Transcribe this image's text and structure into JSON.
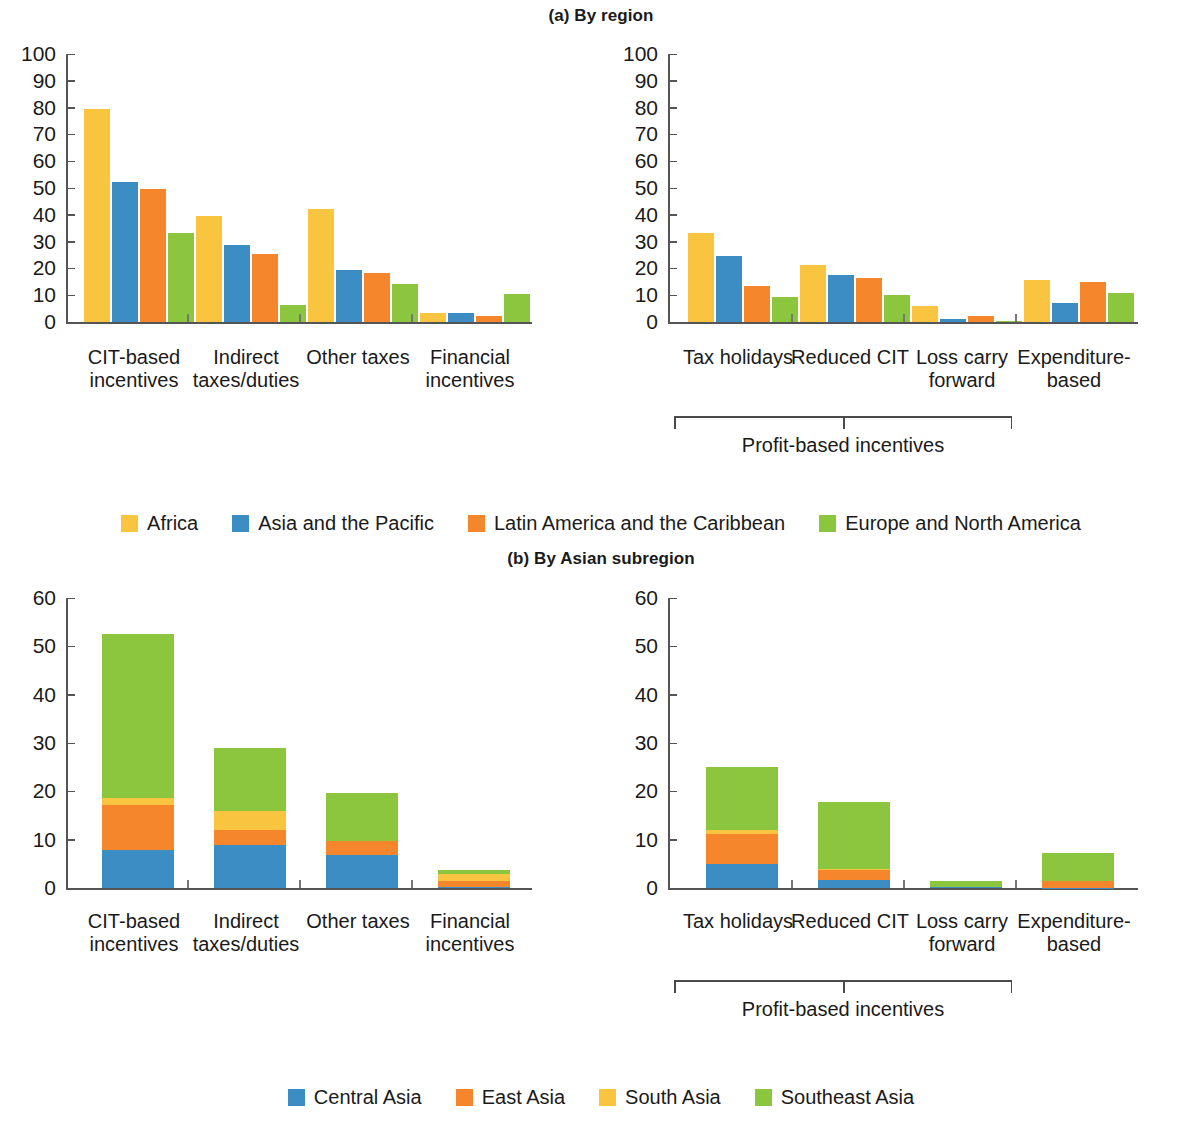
{
  "figure": {
    "panel_a_title": "(a) By region",
    "panel_b_title": "(b) By Asian subregion",
    "bracket_label": "Profit-based incentives"
  },
  "colors": {
    "africa": "#F9C440",
    "asia_pacific": "#3C8DC4",
    "latin_america": "#F6862C",
    "europe_north_america": "#8CC63E",
    "central_asia": "#3C8DC4",
    "east_asia": "#F6862C",
    "south_asia": "#F9C440",
    "southeast_asia": "#8CC63E"
  },
  "legend_a": [
    {
      "label": "Africa",
      "color": "#F9C440"
    },
    {
      "label": "Asia and the Pacific",
      "color": "#3C8DC4"
    },
    {
      "label": "Latin America and the Caribbean",
      "color": "#F6862C"
    },
    {
      "label": "Europe and North America",
      "color": "#8CC63E"
    }
  ],
  "legend_b": [
    {
      "label": "Central Asia",
      "color": "#3C8DC4"
    },
    {
      "label": "East Asia",
      "color": "#F6862C"
    },
    {
      "label": "South Asia",
      "color": "#F9C440"
    },
    {
      "label": "Southeast Asia",
      "color": "#8CC63E"
    }
  ],
  "chart_data": [
    {
      "id": "a-left",
      "type": "bar",
      "title": "(a) By region",
      "subtitle": "General incentive types, by region",
      "grouping": "grouped",
      "categories": [
        "CIT-based\nincentives",
        "Indirect\ntaxes/duties",
        "Other taxes",
        "Financial\nincentives"
      ],
      "series": [
        {
          "name": "Africa",
          "color": "#F9C440",
          "values": [
            79.5,
            39.5,
            42.2,
            3.2
          ]
        },
        {
          "name": "Asia and the Pacific",
          "color": "#3C8DC4",
          "values": [
            52.3,
            28.6,
            19.5,
            3.3
          ]
        },
        {
          "name": "Latin America and the Caribbean",
          "color": "#F6862C",
          "values": [
            49.5,
            25.5,
            18.3,
            2.3
          ]
        },
        {
          "name": "Europe and North America",
          "color": "#8CC63E",
          "values": [
            33.3,
            6.2,
            14.1,
            10.3
          ]
        }
      ],
      "ylim": [
        0,
        100
      ],
      "yticks": [
        0,
        10,
        20,
        30,
        40,
        50,
        60,
        70,
        80,
        90,
        100
      ],
      "ylabel": "",
      "xlabel": "",
      "grid": false,
      "legend_position": "bottom"
    },
    {
      "id": "a-right",
      "type": "bar",
      "title": "(a) By region",
      "subtitle": "Specific incentive instruments, by region",
      "grouping": "grouped",
      "categories": [
        "Tax holidays",
        "Reduced CIT",
        "Loss carry\nforward",
        "Expenditure-\nbased"
      ],
      "series": [
        {
          "name": "Africa",
          "color": "#F9C440",
          "values": [
            33.3,
            21.2,
            6.0,
            15.8
          ]
        },
        {
          "name": "Asia and the Pacific",
          "color": "#3C8DC4",
          "values": [
            24.5,
            17.5,
            1.3,
            7.0
          ]
        },
        {
          "name": "Latin America and the Caribbean",
          "color": "#F6862C",
          "values": [
            13.3,
            16.3,
            2.2,
            15.1
          ]
        },
        {
          "name": "Europe and North America",
          "color": "#8CC63E",
          "values": [
            9.3,
            10.2,
            0.4,
            10.7
          ]
        }
      ],
      "ylim": [
        0,
        100
      ],
      "yticks": [
        0,
        10,
        20,
        30,
        40,
        50,
        60,
        70,
        80,
        90,
        100
      ],
      "bracket": {
        "label": "Profit-based incentives",
        "from": "Tax holidays",
        "to": "Loss carry forward"
      },
      "grid": false,
      "legend_position": "bottom"
    },
    {
      "id": "b-left",
      "type": "bar",
      "title": "(b) By Asian subregion",
      "subtitle": "General incentive types, by Asian subregion",
      "grouping": "stacked",
      "categories": [
        "CIT-based\nincentives",
        "Indirect\ntaxes/duties",
        "Other taxes",
        "Financial\nincentives"
      ],
      "series": [
        {
          "name": "Central Asia",
          "color": "#3C8DC4",
          "values": [
            7.8,
            8.9,
            6.8,
            0.3
          ]
        },
        {
          "name": "East Asia",
          "color": "#F6862C",
          "values": [
            9.3,
            3.2,
            3.0,
            1.2
          ]
        },
        {
          "name": "South Asia",
          "color": "#F9C440",
          "values": [
            1.5,
            3.8,
            0.0,
            1.3
          ]
        },
        {
          "name": "Southeast Asia",
          "color": "#8CC63E",
          "values": [
            34.0,
            13.0,
            9.9,
            1.0
          ]
        }
      ],
      "totals": [
        52.6,
        28.9,
        19.7,
        3.8
      ],
      "ylim": [
        0,
        60
      ],
      "yticks": [
        0,
        10,
        20,
        30,
        40,
        50,
        60
      ],
      "grid": false,
      "legend_position": "bottom"
    },
    {
      "id": "b-right",
      "type": "bar",
      "title": "(b) By Asian subregion",
      "subtitle": "Specific incentive instruments, by Asian subregion",
      "grouping": "stacked",
      "categories": [
        "Tax holidays",
        "Reduced CIT",
        "Loss carry\nforward",
        "Expenditure-\nbased"
      ],
      "series": [
        {
          "name": "Central Asia",
          "color": "#3C8DC4",
          "values": [
            5.0,
            1.6,
            0.2,
            0.1
          ]
        },
        {
          "name": "East Asia",
          "color": "#F6862C",
          "values": [
            6.1,
            2.2,
            0.0,
            1.4
          ]
        },
        {
          "name": "South Asia",
          "color": "#F9C440",
          "values": [
            1.0,
            0.1,
            0.0,
            0.0
          ]
        },
        {
          "name": "Southeast Asia",
          "color": "#8CC63E",
          "values": [
            12.9,
            13.8,
            1.2,
            5.8
          ]
        }
      ],
      "totals": [
        25.0,
        17.7,
        1.4,
        7.3
      ],
      "ylim": [
        0,
        60
      ],
      "yticks": [
        0,
        10,
        20,
        30,
        40,
        50,
        60
      ],
      "bracket": {
        "label": "Profit-based incentives",
        "from": "Tax holidays",
        "to": "Loss carry forward"
      },
      "grid": false,
      "legend_position": "bottom"
    }
  ]
}
